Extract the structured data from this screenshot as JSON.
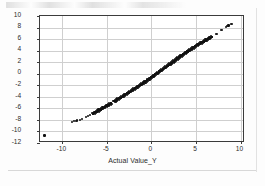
{
  "figure": {
    "background": "#ffffff",
    "frame_color": "#3b3b3b",
    "grid_color": "#cfcfcf",
    "marker_color": "#111111"
  },
  "artifacts": {
    "top_smudge_name": "scan-smudge-top",
    "bottom_line_name": "scan-line-bottom",
    "right_line_name": "scan-line-right",
    "stray_mark_name": "scan-stray-mark"
  },
  "chart_data": {
    "type": "scatter",
    "title": "",
    "xlabel": "Actual Value_Y",
    "ylabel": "Predicted Value_Y",
    "xlim": [
      -12.5,
      10.5
    ],
    "ylim": [
      -12,
      10
    ],
    "xticks": [
      -10,
      -5,
      0,
      5,
      10
    ],
    "yticks": [
      10,
      8,
      6,
      4,
      2,
      0,
      -2,
      -4,
      -6,
      -8,
      -10,
      -12
    ],
    "xtick_labels": [
      "-10",
      "-5",
      "0",
      "5",
      "10"
    ],
    "ytick_labels": [
      "10",
      "8",
      "6",
      "4",
      "2",
      "0",
      "-2",
      "-4",
      "-6",
      "-8",
      "-10",
      "-12"
    ],
    "grid": "both",
    "legend": "none",
    "points": [
      [
        -12.0,
        -10.7
      ],
      [
        -8.9,
        -8.3
      ],
      [
        -8.7,
        -8.25
      ],
      [
        -8.5,
        -8.2
      ],
      [
        -8.3,
        -8.1
      ],
      [
        -8.0,
        -7.95
      ],
      [
        -7.8,
        -7.85
      ],
      [
        -7.3,
        -7.45
      ],
      [
        -7.1,
        -7.35
      ],
      [
        -6.9,
        -7.2
      ],
      [
        -6.6,
        -6.95
      ],
      [
        -6.45,
        -6.85
      ],
      [
        -6.3,
        -6.7
      ],
      [
        -6.15,
        -6.6
      ],
      [
        -6.0,
        -6.45
      ],
      [
        -5.85,
        -6.3
      ],
      [
        -5.7,
        -6.2
      ],
      [
        -5.55,
        -6.05
      ],
      [
        -5.4,
        -5.9
      ],
      [
        -5.25,
        -5.8
      ],
      [
        -5.1,
        -5.65
      ],
      [
        -4.95,
        -5.5
      ],
      [
        -4.8,
        -5.4
      ],
      [
        -4.65,
        -5.25
      ],
      [
        -4.5,
        -5.1
      ],
      [
        -4.2,
        -4.8
      ],
      [
        -4.05,
        -4.7
      ],
      [
        -3.9,
        -4.55
      ],
      [
        -3.75,
        -4.4
      ],
      [
        -3.6,
        -4.25
      ],
      [
        -3.45,
        -4.15
      ],
      [
        -3.3,
        -4.0
      ],
      [
        -3.15,
        -3.85
      ],
      [
        -3.0,
        -3.7
      ],
      [
        -2.85,
        -3.55
      ],
      [
        -2.7,
        -3.4
      ],
      [
        -2.55,
        -3.25
      ],
      [
        -2.4,
        -3.1
      ],
      [
        -2.25,
        -2.95
      ],
      [
        -2.1,
        -2.8
      ],
      [
        -1.95,
        -2.65
      ],
      [
        -1.8,
        -2.5
      ],
      [
        -1.65,
        -2.35
      ],
      [
        -1.5,
        -2.2
      ],
      [
        -1.35,
        -2.05
      ],
      [
        -1.2,
        -1.9
      ],
      [
        -1.05,
        -1.75
      ],
      [
        -0.9,
        -1.6
      ],
      [
        -0.75,
        -1.45
      ],
      [
        -0.6,
        -1.3
      ],
      [
        -0.45,
        -1.1
      ],
      [
        -0.3,
        -0.95
      ],
      [
        -0.15,
        -0.8
      ],
      [
        0.0,
        -0.62
      ],
      [
        0.15,
        -0.45
      ],
      [
        0.3,
        -0.3
      ],
      [
        0.45,
        -0.12
      ],
      [
        0.6,
        0.05
      ],
      [
        0.75,
        0.2
      ],
      [
        0.9,
        0.38
      ],
      [
        1.05,
        0.55
      ],
      [
        1.2,
        0.7
      ],
      [
        1.35,
        0.88
      ],
      [
        1.5,
        1.05
      ],
      [
        1.65,
        1.2
      ],
      [
        1.8,
        1.38
      ],
      [
        1.95,
        1.55
      ],
      [
        2.1,
        1.7
      ],
      [
        2.25,
        1.88
      ],
      [
        2.4,
        2.05
      ],
      [
        2.55,
        2.2
      ],
      [
        2.7,
        2.38
      ],
      [
        2.85,
        2.55
      ],
      [
        3.0,
        2.7
      ],
      [
        3.15,
        2.88
      ],
      [
        3.3,
        3.05
      ],
      [
        3.45,
        3.2
      ],
      [
        3.6,
        3.38
      ],
      [
        3.75,
        3.52
      ],
      [
        3.9,
        3.68
      ],
      [
        4.05,
        3.85
      ],
      [
        4.2,
        4.0
      ],
      [
        4.35,
        4.15
      ],
      [
        4.5,
        4.3
      ],
      [
        4.65,
        4.45
      ],
      [
        4.8,
        4.6
      ],
      [
        4.95,
        4.75
      ],
      [
        5.1,
        4.9
      ],
      [
        5.25,
        5.05
      ],
      [
        5.4,
        5.18
      ],
      [
        5.55,
        5.32
      ],
      [
        5.7,
        5.45
      ],
      [
        5.85,
        5.58
      ],
      [
        6.0,
        5.72
      ],
      [
        6.15,
        5.85
      ],
      [
        6.3,
        5.98
      ],
      [
        6.45,
        6.1
      ],
      [
        6.6,
        6.25
      ],
      [
        6.75,
        6.4
      ],
      [
        7.2,
        6.85
      ],
      [
        7.35,
        6.95
      ],
      [
        7.8,
        7.55
      ],
      [
        7.95,
        7.65
      ],
      [
        8.35,
        8.1
      ],
      [
        8.5,
        8.25
      ],
      [
        8.65,
        8.35
      ],
      [
        8.9,
        8.6
      ],
      [
        9.05,
        8.65
      ]
    ]
  }
}
